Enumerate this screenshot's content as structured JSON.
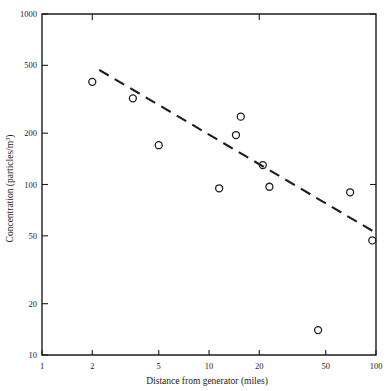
{
  "chart_data": {
    "type": "scatter",
    "title": "",
    "xlabel": "Distance from generator (miles)",
    "ylabel": "Concentration (particles/m3)",
    "ylabel_base": "Concentration (particles/m",
    "ylabel_sup": "3",
    "ylabel_close": ")",
    "xscale": "log",
    "yscale": "log",
    "xlim": [
      1,
      100
    ],
    "ylim": [
      10,
      1000
    ],
    "grid": false,
    "legend": null,
    "xticks": [
      1,
      2,
      5,
      10,
      20,
      50,
      100
    ],
    "xtick_labels": [
      "1",
      "2",
      "5",
      "10",
      "20",
      "50",
      "100"
    ],
    "yticks": [
      10,
      20,
      50,
      100,
      200,
      500,
      1000
    ],
    "ytick_labels": [
      "10",
      "20",
      "50",
      "100",
      "200",
      "500",
      "1000"
    ],
    "marker": "open-circle",
    "points": [
      {
        "x": 2.0,
        "y": 400
      },
      {
        "x": 3.5,
        "y": 320
      },
      {
        "x": 5.0,
        "y": 170
      },
      {
        "x": 11.5,
        "y": 95
      },
      {
        "x": 14.5,
        "y": 195
      },
      {
        "x": 15.5,
        "y": 250
      },
      {
        "x": 21.0,
        "y": 130
      },
      {
        "x": 23.0,
        "y": 97
      },
      {
        "x": 45.0,
        "y": 14
      },
      {
        "x": 70.0,
        "y": 90
      },
      {
        "x": 95.0,
        "y": 47
      }
    ],
    "trendline": {
      "style": "dashed",
      "x_start": 2.2,
      "y_start": 470,
      "x_end": 100,
      "y_end": 52
    },
    "colors": {
      "axis": "#1d1d1d",
      "marker": "#1d1d1d",
      "trendline": "#1d1d1d",
      "background": "#ffffff"
    }
  }
}
